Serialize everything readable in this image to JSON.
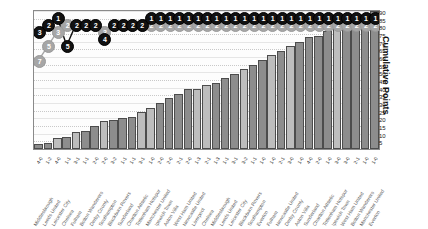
{
  "chart_data": {
    "type": "bar",
    "title": "",
    "xlabel": "",
    "ylabel": "Cumulative Points",
    "ylim": [
      0,
      90
    ],
    "ytick_labels": [
      "90",
      "85",
      "80",
      "75",
      "70",
      "65",
      "60",
      "55",
      "50",
      "45",
      "40",
      "35",
      "30",
      "25",
      "20",
      "15",
      "10",
      "5"
    ],
    "grid": true,
    "legend_position": "none",
    "categories": [
      "Middlesbrough",
      "Leeds United",
      "Leicester City",
      "Chelsea",
      "Fulham",
      "Bolton Wanderers",
      "Derby County",
      "Southampton",
      "Blackburn Rovers",
      "Sunderland",
      "Charlton Athletic",
      "Tottenham Hotspur",
      "Manchester United",
      "Ipswich Town",
      "Aston Villa",
      "West Ham United",
      "Newcastle United",
      "Liverpool",
      "Chelsea",
      "Middlesbrough",
      "Leeds United",
      "Leicester City",
      "Blackburn Rovers",
      "Southampton",
      "Everton",
      "Fulham",
      "Newcastle United",
      "Derby County",
      "Aston Villa",
      "Sunderland",
      "Charlton Athletic",
      "Tottenham Hotspur",
      "Ipswich Town",
      "West Ham United",
      "Bolton Wanderers",
      "Manchester United",
      "Everton"
    ],
    "scores": [
      "4-0",
      "1-2",
      "4-0",
      "1-1",
      "3-1",
      "1-1",
      "2-0",
      "2-0",
      "3-2",
      "1-1",
      "1-1",
      "3-1",
      "1-0",
      "2-0",
      "2-0",
      "2-1",
      "2-0",
      "1-3",
      "2-1",
      "1-3",
      "1-1",
      "3-1",
      "3-2",
      "1-1",
      "1-0",
      "1-0",
      "2-1",
      "3-0",
      "1-0",
      "4-0",
      "2-0",
      "1-0",
      "3-0",
      "3-0",
      "2-1",
      "1-0",
      "1-0"
    ],
    "series": [
      {
        "name": "Cumulative Points",
        "type": "bar",
        "values": [
          3,
          4,
          7,
          8,
          11,
          12,
          15,
          18,
          19,
          20,
          21,
          24,
          27,
          30,
          33,
          36,
          39,
          39,
          42,
          43,
          46,
          49,
          52,
          55,
          58,
          61,
          64,
          67,
          70,
          73,
          74,
          77,
          80,
          81,
          84,
          87,
          90
        ]
      },
      {
        "name": "League Position (black)",
        "type": "line",
        "values": [
          3,
          2,
          1,
          5,
          2,
          2,
          2,
          4,
          2,
          2,
          2,
          2,
          1,
          1,
          1,
          1,
          1,
          1,
          1,
          1,
          1,
          1,
          1,
          1,
          1,
          1,
          1,
          1,
          1,
          1,
          1,
          1,
          1,
          1,
          1,
          1,
          1
        ]
      },
      {
        "name": "League Position (grey)",
        "type": "line",
        "values": [
          7,
          5,
          3,
          2,
          2,
          2,
          2,
          3,
          2,
          2,
          2,
          2,
          2,
          2,
          2,
          2,
          2,
          2,
          2,
          2,
          2,
          2,
          2,
          2,
          2,
          2,
          2,
          2,
          2,
          2,
          2,
          2,
          2,
          2,
          2,
          2,
          2
        ]
      }
    ]
  }
}
